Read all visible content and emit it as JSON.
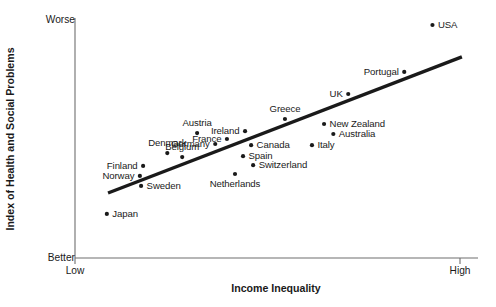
{
  "chart_data": {
    "type": "scatter",
    "title": "",
    "xlabel": "Income Inequality",
    "ylabel": "Index of Health and Social Problems",
    "x_axis_ticks": [
      "Low",
      "High"
    ],
    "y_axis_ticks": [
      "Better",
      "Worse"
    ],
    "x_tick_low_label": "Low",
    "x_tick_high_label": "High",
    "y_tick_top_label": "Worse",
    "y_tick_bottom_label": "Better",
    "xlim": [
      0,
      1
    ],
    "ylim": [
      0,
      1
    ],
    "grid": false,
    "legend": "none",
    "series_color": "#1a1a1a",
    "trendline": {
      "present": true,
      "color": "#1a1a1a",
      "x_start": 0.082,
      "y_start": 0.273,
      "x_end": 0.96,
      "y_end": 0.845
    },
    "points": [
      {
        "label": "Japan",
        "x": 0.079,
        "y": 0.185,
        "label_pos": "right"
      },
      {
        "label": "Sweden",
        "x": 0.164,
        "y": 0.303,
        "label_pos": "right"
      },
      {
        "label": "Norway",
        "x": 0.161,
        "y": 0.345,
        "label_pos": "left"
      },
      {
        "label": "Finland",
        "x": 0.169,
        "y": 0.387,
        "label_pos": "left"
      },
      {
        "label": "Denmark",
        "x": 0.229,
        "y": 0.441,
        "label_pos": "above"
      },
      {
        "label": "Belgium",
        "x": 0.266,
        "y": 0.424,
        "label_pos": "above"
      },
      {
        "label": "Austria",
        "x": 0.303,
        "y": 0.525,
        "label_pos": "above"
      },
      {
        "label": "Germany",
        "x": 0.348,
        "y": 0.479,
        "label_pos": "left"
      },
      {
        "label": "Netherlands",
        "x": 0.397,
        "y": 0.353,
        "label_pos": "below"
      },
      {
        "label": "France",
        "x": 0.377,
        "y": 0.5,
        "label_pos": "left"
      },
      {
        "label": "Ireland",
        "x": 0.422,
        "y": 0.533,
        "label_pos": "left"
      },
      {
        "label": "Spain",
        "x": 0.417,
        "y": 0.428,
        "label_pos": "right"
      },
      {
        "label": "Canada",
        "x": 0.437,
        "y": 0.474,
        "label_pos": "right"
      },
      {
        "label": "Switzerland",
        "x": 0.442,
        "y": 0.39,
        "label_pos": "right"
      },
      {
        "label": "Greece",
        "x": 0.521,
        "y": 0.584,
        "label_pos": "above"
      },
      {
        "label": "Italy",
        "x": 0.588,
        "y": 0.474,
        "label_pos": "right"
      },
      {
        "label": "New Zealand",
        "x": 0.618,
        "y": 0.563,
        "label_pos": "right"
      },
      {
        "label": "Australia",
        "x": 0.641,
        "y": 0.521,
        "label_pos": "right"
      },
      {
        "label": "UK",
        "x": 0.678,
        "y": 0.689,
        "label_pos": "left"
      },
      {
        "label": "Portugal",
        "x": 0.817,
        "y": 0.782,
        "label_pos": "left"
      },
      {
        "label": "USA",
        "x": 0.887,
        "y": 0.979,
        "label_pos": "right"
      }
    ]
  }
}
